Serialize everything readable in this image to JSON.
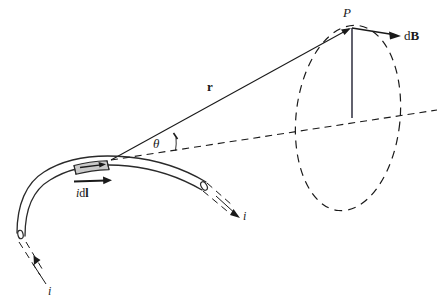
{
  "figure": {
    "kind": "physics-diagram",
    "topic": "Biot-Savart law: magnetic field dB at point P due to current element i dl",
    "page_marker": "",
    "background_color": "#ffffff",
    "ink_color": "#1a1a1a",
    "segment_fill_color": "#c9c9c9"
  },
  "labels": {
    "point_p": "P",
    "vector_r": "r",
    "angle_theta": "θ",
    "field_db_d": "d",
    "field_db_b": "B",
    "current_element_i": "i",
    "current_element_d": "d",
    "current_element_l": "l",
    "current_left": "i",
    "current_right": "i"
  },
  "elements": {
    "wire": {
      "name": "current-carrying-wire",
      "description": "curved tube drawn as two parallel arcs with open elliptical end caps"
    },
    "current_element": {
      "name": "current-element-segment",
      "description": "shaded gray band across the wire marking i dl"
    },
    "field_circle": {
      "name": "magnetic-field-circle",
      "description": "dashed ellipse representing the circular field line through P"
    },
    "axis": {
      "name": "dashed-axis-line",
      "description": "dashed straight line from the current element through the field circle"
    },
    "radius": {
      "name": "field-circle-radius",
      "description": "solid vertical line from P down to the dashed axis"
    }
  }
}
